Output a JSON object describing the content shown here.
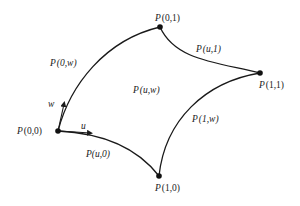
{
  "diagram": {
    "colors": {
      "stroke": "#1a1a1a",
      "background": "#ffffff"
    },
    "corners": [
      {
        "id": "p00",
        "label_fn": "P",
        "label_args": "(0,0)",
        "x": 58,
        "y": 131
      },
      {
        "id": "p01",
        "label_fn": "P",
        "label_args": "(0,1)",
        "x": 160,
        "y": 27
      },
      {
        "id": "p11",
        "label_fn": "P",
        "label_args": "(1,1)",
        "x": 260,
        "y": 73
      },
      {
        "id": "p10",
        "label_fn": "P",
        "label_args": "(1,0)",
        "x": 159,
        "y": 176
      }
    ],
    "edges": [
      {
        "id": "edge-0w",
        "label_fn": "P",
        "label_args": "(0,w)"
      },
      {
        "id": "edge-u1",
        "label_fn": "P",
        "label_args": "(u,1)"
      },
      {
        "id": "edge-1w",
        "label_fn": "P",
        "label_args": "(1,w)"
      },
      {
        "id": "edge-u0",
        "label_fn": "P",
        "label_args": "(u,0)"
      }
    ],
    "surface": {
      "label_fn": "P",
      "label_args": "(u,w)"
    },
    "directions": {
      "u": "u",
      "w": "w"
    }
  }
}
